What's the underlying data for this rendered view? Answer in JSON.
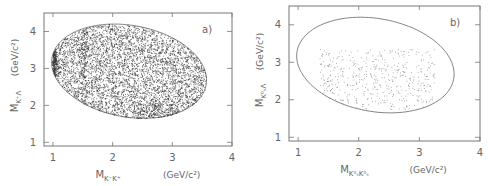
{
  "chart_data": [
    {
      "type": "scatter",
      "panel_label": "a)",
      "title": "",
      "xlabel": "M_{K^- K^+} (GeV/c^2)",
      "xlabel_main": "M",
      "xlabel_sub": "K⁻K⁺",
      "xlabel_unit": "(GeV/c²)",
      "ylabel": "M_{K^+ Λ} (GeV/c^2)",
      "ylabel_main": "M",
      "ylabel_sub": "K⁺Λ",
      "ylabel_unit": "(GeV/c²)",
      "xlim": [
        0.85,
        4.0
      ],
      "ylim": [
        0.9,
        4.5
      ],
      "xticks": [
        "1",
        "2",
        "3",
        "4"
      ],
      "yticks": [
        "1",
        "2",
        "3",
        "4"
      ],
      "grid": false,
      "description": "Dalitz plot, densely populated inside kinematic boundary ellipse; dense vertical band near M_KK ≈ 1.02 (phi) and ≈ 1.5; enhancement along lower edge near M_KK ≈ 2.6-3.0",
      "boundary": {
        "x_min": 1.0,
        "x_max": 3.55,
        "y_min": 1.65,
        "y_max": 4.2
      },
      "point_density": "high"
    },
    {
      "type": "scatter",
      "panel_label": "b)",
      "title": "",
      "xlabel": "M_{K^0_S K^0_S} (GeV/c^2)",
      "xlabel_main": "M",
      "xlabel_sub": "K⁰ₛK⁰ₛ",
      "xlabel_unit": "(GeV/c²)",
      "ylabel": "M_{K^0_S Λ} (GeV/c^2)",
      "ylabel_main": "M",
      "ylabel_sub": "K⁰ₛΛ",
      "ylabel_unit": "(GeV/c²)",
      "xlim": [
        0.85,
        4.0
      ],
      "ylim": [
        0.9,
        4.5
      ],
      "xticks": [
        "1",
        "2",
        "3",
        "4"
      ],
      "yticks": [
        "1",
        "2",
        "3",
        "4"
      ],
      "grid": false,
      "description": "Dalitz plot, sparsely populated; points concentrated in region M_KK 1.4-3.2, M_KΛ 1.8-3.3 with vertical band near 1.5",
      "boundary": {
        "x_min": 1.0,
        "x_max": 3.55,
        "y_min": 1.65,
        "y_max": 4.2
      },
      "point_density": "low"
    }
  ],
  "colors": {
    "ink": "#555555",
    "points": "#333333",
    "frame": "#777777"
  }
}
